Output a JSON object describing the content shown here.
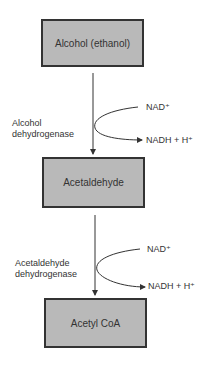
{
  "nodes": [
    {
      "id": "ethanol",
      "label": "Alcohol (ethanol)"
    },
    {
      "id": "acetaldehyde",
      "label": "Acetaldehyde"
    },
    {
      "id": "acetyl_coa",
      "label": "Acetyl CoA"
    }
  ],
  "steps": [
    {
      "enzyme_line1": "Alcohol",
      "enzyme_line2": "dehydrogenase",
      "cofactor_in": "NAD⁺",
      "cofactor_out": "NADH + H⁺"
    },
    {
      "enzyme_line1": "Acetaldehyde",
      "enzyme_line2": "dehydrogenase",
      "cofactor_in": "NAD⁺",
      "cofactor_out": "NADH + H⁺"
    }
  ],
  "colors": {
    "box_fill": "#b9b9b9",
    "box_border": "#333333",
    "line": "#333333"
  }
}
